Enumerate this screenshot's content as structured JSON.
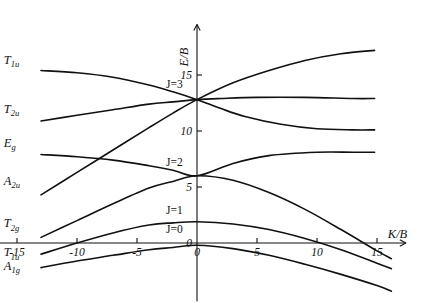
{
  "figure": {
    "title": "",
    "background": "#ffffff",
    "line_color": "#111111"
  },
  "axes": {
    "x_title": "K/B",
    "y_title": "E/B",
    "x_arrow": "right-arrow",
    "y_arrow": "up-arrow"
  },
  "chart_data": {
    "type": "line",
    "title": "",
    "xlabel": "K/B",
    "ylabel": "E/B",
    "xlim": [
      -16.5,
      17.5
    ],
    "ylim": [
      -2.0,
      18.0
    ],
    "grid": false,
    "legend_position": "none",
    "x_ticks": [
      -15,
      -10,
      -5,
      0,
      5,
      10,
      15
    ],
    "x_tick_labels": [
      "-15",
      "-10",
      "-5",
      "0",
      "5",
      "10",
      "15"
    ],
    "y_ticks": [
      0,
      5,
      10,
      15
    ],
    "y_tick_labels": [
      "0",
      "5",
      "10",
      "15"
    ],
    "annotations": [
      {
        "text": "J=3",
        "x": 0.0,
        "y": 13.8
      },
      {
        "text": "J=2",
        "x": 0.0,
        "y": 6.9
      },
      {
        "text": "J=1",
        "x": 0.0,
        "y": 2.6
      },
      {
        "text": "J=0",
        "x": 0.0,
        "y": 0.9
      }
    ],
    "convergence_levels": {
      "J=3": 12.8,
      "J=2": 6.0,
      "J=1": 1.9,
      "J=0": 0.3
    },
    "series": [
      {
        "name": "T_1u",
        "label": "T",
        "label_sub": "1u",
        "label_x": -16.1,
        "label_y": 16.0,
        "x": [
          -13.0,
          -10.0,
          -7.0,
          -4.0,
          -2.0,
          0.0,
          2.0,
          4.0,
          7.0,
          10.0,
          13.0,
          14.8
        ],
        "y": [
          15.4,
          15.2,
          14.8,
          14.1,
          13.5,
          12.8,
          12.0,
          11.3,
          10.6,
          10.2,
          10.1,
          10.1
        ]
      },
      {
        "name": "T_2u",
        "label": "T",
        "label_sub": "2u",
        "label_x": -16.1,
        "label_y": 11.6,
        "x": [
          -13.0,
          -10.0,
          -7.0,
          -4.0,
          -2.0,
          0.0,
          2.0,
          5.0,
          9.0,
          13.0,
          14.8
        ],
        "y": [
          10.9,
          11.4,
          11.9,
          12.4,
          12.6,
          12.8,
          12.9,
          13.0,
          13.0,
          12.9,
          12.9
        ]
      },
      {
        "name": "E_g",
        "label": "E",
        "label_sub": "g",
        "label_x": -16.1,
        "label_y": 8.6,
        "x": [
          -13.0,
          -10.0,
          -7.0,
          -4.0,
          -2.0,
          0.0,
          3.0,
          6.0,
          10.0,
          13.0,
          14.8
        ],
        "y": [
          7.9,
          7.7,
          7.4,
          6.9,
          6.5,
          6.0,
          7.1,
          7.8,
          8.1,
          8.1,
          8.1
        ]
      },
      {
        "name": "A_2u",
        "label": "A",
        "label_sub": "2u",
        "label_x": -16.1,
        "label_y": 5.2,
        "x": [
          -13.0,
          -10.0,
          -7.0,
          -4.0,
          -2.0,
          0.0,
          3.0,
          6.0,
          9.0,
          12.0,
          14.8
        ],
        "y": [
          4.3,
          6.3,
          8.3,
          10.3,
          11.6,
          12.8,
          14.3,
          15.4,
          16.3,
          16.9,
          17.2
        ]
      },
      {
        "name": "T_2g",
        "label": "T",
        "label_sub": "2g",
        "label_x": -16.1,
        "label_y": 1.4,
        "x": [
          -13.0,
          -10.0,
          -7.0,
          -4.0,
          -2.0,
          0.0,
          3.0,
          6.0,
          9.0,
          12.0,
          15.0,
          16.2
        ],
        "y": [
          0.5,
          2.0,
          3.5,
          4.9,
          5.5,
          6.0,
          5.6,
          4.5,
          3.0,
          1.2,
          -0.7,
          -1.4
        ]
      },
      {
        "name": "T_1u_lower",
        "label": "T",
        "label_sub": "1u",
        "label_x": -16.1,
        "label_y": -1.2,
        "x": [
          -13.0,
          -10.0,
          -7.0,
          -4.0,
          -2.0,
          0.0,
          3.0,
          6.0,
          9.0,
          12.0,
          15.0,
          16.2
        ],
        "y": [
          -1.0,
          0.0,
          0.9,
          1.6,
          1.8,
          1.9,
          1.7,
          1.2,
          0.4,
          -0.6,
          -1.8,
          -2.3
        ]
      },
      {
        "name": "A_1g",
        "label": "A",
        "label_sub": "1g",
        "label_x": -16.1,
        "label_y": -2.4,
        "x": [
          -13.0,
          -10.0,
          -7.0,
          -4.0,
          -2.0,
          0.0,
          3.0,
          6.0,
          9.0,
          12.0,
          15.0,
          16.2
        ],
        "y": [
          -2.2,
          -1.6,
          -1.1,
          -0.6,
          -0.4,
          -0.2,
          -0.5,
          -1.1,
          -1.9,
          -2.8,
          -3.8,
          -4.3
        ]
      }
    ]
  }
}
